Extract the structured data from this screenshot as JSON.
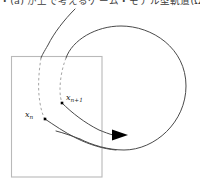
{
  "figure": {
    "header_text": "・(a) が上で考えるゲーム・モデル型軌道(Ω)",
    "background_color": "#ffffff",
    "caption_color": "#3b3b3b"
  },
  "labels": {
    "x_n": {
      "base": "x",
      "sub_prefix": "n",
      "sub_op": "",
      "sub_suffix": ""
    },
    "x_n_plus_1": {
      "base": "x",
      "sub_prefix": "n",
      "sub_op": "+",
      "sub_suffix": "1"
    }
  },
  "shapes": {
    "rectangle": {
      "name": "section-rectangle",
      "x": 11,
      "y": 56,
      "width": 91,
      "height": 121,
      "stroke": "#b9b9b9",
      "stroke_width": 1.1,
      "fill": "none"
    },
    "orbit_ellipse": {
      "name": "large-orbit-curve",
      "stroke": "#4a4a4a",
      "stroke_width": 1.0,
      "x_range": [
        65,
        186
      ],
      "y_range": [
        26,
        150
      ]
    },
    "entering_arc": {
      "name": "incoming-trajectory-arc",
      "stroke": "#4a4a4a",
      "stroke_width": 1.0,
      "start": [
        75,
        9
      ],
      "end": [
        45,
        119
      ]
    },
    "dashed_segments": {
      "name": "dashed-return-segments",
      "stroke": "#9a9a9a",
      "stroke_width": 0.9,
      "dash_pattern": "2.5 2.5",
      "count": 2
    },
    "arrowhead": {
      "name": "direction-arrowhead",
      "fill": "#000000",
      "tip": [
        128,
        135
      ],
      "back_top": [
        112,
        129
      ],
      "back_bottom": [
        112,
        141
      ]
    },
    "points": [
      {
        "name": "point-xn",
        "cx": 45,
        "cy": 119,
        "size": 2.6,
        "fill": "#000000"
      },
      {
        "name": "point-xn1",
        "cx": 62,
        "cy": 103,
        "size": 2.6,
        "fill": "#000000"
      }
    ]
  }
}
